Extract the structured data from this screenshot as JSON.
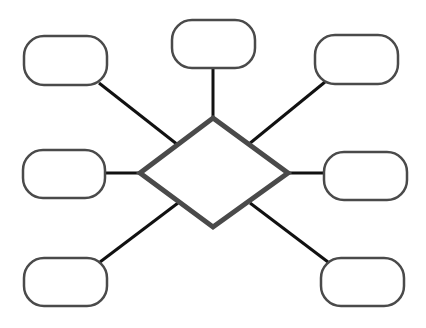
{
  "diagram": {
    "type": "hub-and-spoke",
    "colors": {
      "background": "#ffffff",
      "hub_stroke": "#4a4a4a",
      "node_stroke": "#4a4a4a",
      "connector": "#111111"
    },
    "hub": {
      "shape": "diamond",
      "label": ""
    },
    "nodes": [
      {
        "id": "top-left",
        "label": ""
      },
      {
        "id": "top-center",
        "label": ""
      },
      {
        "id": "top-right",
        "label": ""
      },
      {
        "id": "middle-left",
        "label": ""
      },
      {
        "id": "middle-right",
        "label": ""
      },
      {
        "id": "bottom-left",
        "label": ""
      },
      {
        "id": "bottom-right",
        "label": ""
      }
    ]
  }
}
